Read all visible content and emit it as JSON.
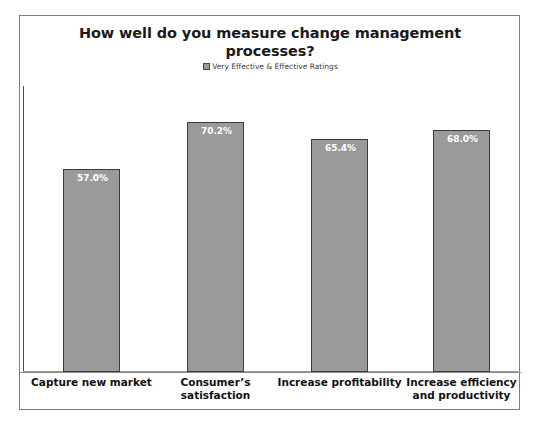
{
  "chart_data": {
    "type": "bar",
    "title": "How well do you measure change management processes?",
    "legend": {
      "position": "top-center",
      "entries": [
        "Very Effective & Effective Ratings"
      ],
      "marker": "square-swatch"
    },
    "categories": [
      "Capture new market",
      "Consumer’s satisfaction",
      "Increase profitability",
      "Increase efficiency and productivity"
    ],
    "values": [
      57.0,
      65.4,
      68.0,
      70.2
    ],
    "value_labels": [
      "57.0%",
      "70.2%",
      "65.4%",
      "68.0%"
    ],
    "series": [
      {
        "name": "Very Effective & Effective Ratings",
        "values": [
          57.0,
          70.2,
          65.4,
          68.0
        ]
      }
    ],
    "xlabel": "",
    "ylabel": "",
    "ylim": [
      0,
      80
    ],
    "grid": false,
    "bar_color": "#9a9a9a",
    "bar_border_color": "#3c3c3c",
    "value_label_color": "#ffffff"
  },
  "chart": {
    "title": "How well do you measure change management processes?",
    "legend_label": "Very Effective & Effective Ratings",
    "bars": [
      {
        "label_line1": "Capture new market",
        "label_line2": "",
        "value_label": "57.0%",
        "value": 57.0
      },
      {
        "label_line1": "Consumer’s",
        "label_line2": "satisfaction",
        "value_label": "70.2%",
        "value": 70.2
      },
      {
        "label_line1": "Increase profitability",
        "label_line2": "",
        "value_label": "65.4%",
        "value": 65.4
      },
      {
        "label_line1": "Increase efficiency",
        "label_line2": "and productivity",
        "value_label": "68.0%",
        "value": 68.0
      }
    ]
  }
}
